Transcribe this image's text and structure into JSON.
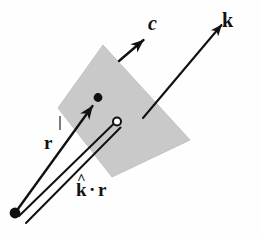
{
  "figure": {
    "background_color": "#fefefe",
    "ink_color": "#111111",
    "plane": {
      "name": "wavefront-plane",
      "fill_color": "#c9c9c9",
      "stroke_color": "#bdbdbd",
      "vertices": "103,45 190,140 112,177 58,108"
    },
    "labels": {
      "c": "c",
      "k": "k",
      "r": "r",
      "k_hat": "k",
      "k_hat_accent": "^",
      "dot": "·",
      "r_of_dot": "r"
    },
    "vectors": [
      {
        "name": "k-vector",
        "label": "k",
        "from_x": 143,
        "from_y": 118,
        "to_x": 226,
        "to_y": 20,
        "style": "solid-arrow",
        "width": 2.0
      },
      {
        "name": "c-vector",
        "label": "c",
        "from_x": 120,
        "from_y": 60,
        "to_x": 149,
        "to_y": 35,
        "style": "solid-arrow",
        "width": 2.2
      },
      {
        "name": "r-vector",
        "label": "r",
        "from_x": 15,
        "from_y": 213,
        "to_x": 97,
        "to_y": 100,
        "style": "solid-arrow-with-tip-dot",
        "width": 2.2
      },
      {
        "name": "k-hat-dot-r-projection",
        "label": "k̂ · r",
        "from_x": 17,
        "from_y": 217,
        "to_x": 116,
        "to_y": 121,
        "style": "double-line-tube",
        "width": 2.0
      }
    ],
    "markers": [
      {
        "name": "origin-point",
        "x": 15,
        "y": 213,
        "type": "filled-dot",
        "radius": 5.5
      },
      {
        "name": "field-point",
        "x": 98,
        "y": 98,
        "type": "filled-dot",
        "radius": 4.5
      },
      {
        "name": "projection-endpoint",
        "x": 117,
        "y": 121,
        "type": "open-circle",
        "radius": 4.0
      },
      {
        "name": "r-tick-mark",
        "x": 60,
        "y": 120,
        "type": "short-tick"
      }
    ]
  }
}
